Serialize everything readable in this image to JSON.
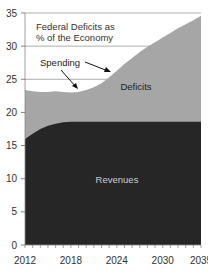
{
  "chart_data": {
    "type": "area",
    "title": "Federal Deficits as % of the Economy",
    "title_lines": [
      "Federal Deficits as",
      "% of the Economy"
    ],
    "xlabel": "",
    "ylabel": "",
    "xlim": [
      2012,
      2035
    ],
    "ylim": [
      0,
      35
    ],
    "x_ticks": [
      2012,
      2018,
      2024,
      2030,
      2035
    ],
    "x_tick_labels": [
      "2012",
      "2018",
      "2024",
      "2030",
      "2035"
    ],
    "y_ticks": [
      0,
      5,
      10,
      15,
      20,
      25,
      30,
      35
    ],
    "y_tick_labels": [
      "0",
      "5",
      "10",
      "15",
      "20",
      "25",
      "30",
      "35"
    ],
    "grid": "horizontal lines at 25, 30, 35",
    "x": [
      2012,
      2013,
      2014,
      2015,
      2016,
      2017,
      2018,
      2019,
      2020,
      2021,
      2022,
      2023,
      2024,
      2025,
      2026,
      2027,
      2028,
      2029,
      2030,
      2031,
      2032,
      2033,
      2034,
      2035
    ],
    "series": [
      {
        "name": "Spending",
        "values": [
          23.4,
          23.2,
          23.1,
          23.1,
          23.2,
          23.1,
          23.0,
          23.1,
          23.4,
          23.8,
          24.4,
          25.3,
          26.3,
          27.3,
          28.2,
          29.1,
          29.9,
          30.6,
          31.3,
          32.0,
          32.7,
          33.3,
          33.9,
          34.6
        ]
      },
      {
        "name": "Revenues",
        "values": [
          16.0,
          16.8,
          17.5,
          18.0,
          18.3,
          18.5,
          18.6,
          18.6,
          18.6,
          18.6,
          18.6,
          18.6,
          18.6,
          18.6,
          18.6,
          18.6,
          18.6,
          18.6,
          18.6,
          18.6,
          18.6,
          18.6,
          18.6,
          18.6
        ]
      }
    ],
    "area_labels": [
      {
        "name": "Deficits",
        "text": "Deficits"
      },
      {
        "name": "Revenues",
        "text": "Revenues"
      }
    ],
    "annotations": [
      {
        "text": "Spending",
        "arrows": 2
      }
    ],
    "colors": {
      "revenues": "#262626",
      "deficits": "#a6a6a6",
      "background": "#ffffff",
      "grid": "#999999"
    }
  }
}
